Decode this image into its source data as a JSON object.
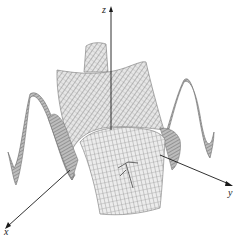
{
  "figure": {
    "type": "3d-surface-wireframe",
    "colors": {
      "mesh": "#6e6e6e",
      "mesh_light": "#9a9a9a",
      "fill": "#d8d8d8",
      "axis": "#1a1a1a",
      "background": "#ffffff"
    }
  },
  "axes": {
    "x": {
      "label": "x"
    },
    "y": {
      "label": "y"
    },
    "z": {
      "label": "z"
    }
  }
}
